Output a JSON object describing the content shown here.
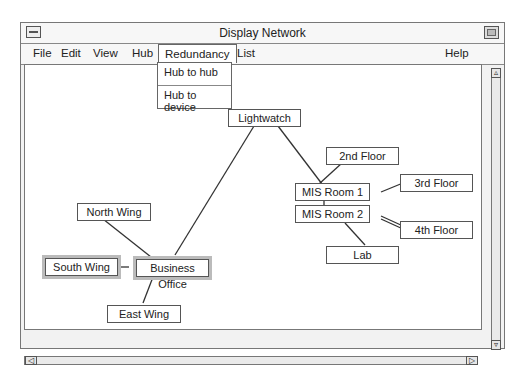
{
  "window": {
    "title": "Display Network"
  },
  "menubar": {
    "items": [
      {
        "label": "File"
      },
      {
        "label": "Edit"
      },
      {
        "label": "View"
      },
      {
        "label": "Hub"
      },
      {
        "label": "Redundancy"
      },
      {
        "label": "List"
      },
      {
        "label": "Help"
      }
    ]
  },
  "dropdown": {
    "parent": "Redundancy",
    "items": [
      {
        "label": "Hub to hub"
      },
      {
        "label": "Hub to device"
      }
    ]
  },
  "network": {
    "nodes": [
      {
        "id": "lightwatch",
        "label": "Lightwatch"
      },
      {
        "id": "2nd-floor",
        "label": "2nd Floor"
      },
      {
        "id": "3rd-floor",
        "label": "3rd Floor"
      },
      {
        "id": "mis-room-1",
        "label": "MIS Room 1"
      },
      {
        "id": "mis-room-2",
        "label": "MIS Room 2"
      },
      {
        "id": "4th-floor",
        "label": "4th Floor"
      },
      {
        "id": "lab",
        "label": "Lab"
      },
      {
        "id": "north-wing",
        "label": "North Wing"
      },
      {
        "id": "south-wing",
        "label": "South Wing"
      },
      {
        "id": "business-office",
        "label": "Business Office"
      },
      {
        "id": "east-wing",
        "label": "East Wing"
      }
    ]
  },
  "scrollbars": {
    "up_icon": "▵",
    "down_icon": "▿",
    "left_icon": "◁",
    "right_icon": "▷"
  }
}
